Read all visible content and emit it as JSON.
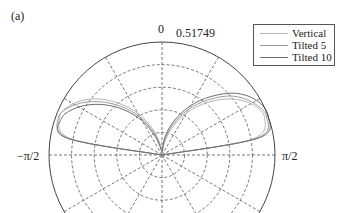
{
  "panel_label": "(a)",
  "chart_data": {
    "type": "polar-line",
    "title": "",
    "panel": "(a)",
    "theta_zero_location": "top",
    "theta_range_visible": [
      "-pi/2",
      "pi/2"
    ],
    "theta_tick_labels": {
      "top": "0",
      "left": "−π/2",
      "right": "π/2"
    },
    "r_max_label": "0.51749",
    "r_max": 0.51749,
    "r_rings": 5,
    "spoke_step_deg": 30,
    "grid": true,
    "legend_position": "upper right",
    "series": [
      {
        "name": "Vertical",
        "color": "#b4b4b4",
        "theta_deg": [
          -90,
          -80,
          -70,
          -60,
          -50,
          -40,
          -30,
          -20,
          -10,
          0,
          10,
          20,
          30,
          40,
          50,
          60,
          70,
          80,
          90
        ],
        "r": [
          0.0,
          0.42,
          0.5,
          0.47,
          0.4,
          0.31,
          0.22,
          0.13,
          0.05,
          0.0,
          0.05,
          0.13,
          0.22,
          0.31,
          0.4,
          0.47,
          0.5,
          0.42,
          0.0
        ]
      },
      {
        "name": "Tilted 5",
        "color": "#9a9a9a",
        "theta_deg": [
          -90,
          -80,
          -70,
          -60,
          -50,
          -40,
          -30,
          -20,
          -10,
          0,
          10,
          20,
          30,
          40,
          50,
          60,
          70,
          80,
          90
        ],
        "r": [
          0.0,
          0.43,
          0.505,
          0.46,
          0.38,
          0.29,
          0.2,
          0.11,
          0.04,
          0.01,
          0.07,
          0.15,
          0.24,
          0.33,
          0.42,
          0.48,
          0.51,
          0.44,
          0.0
        ]
      },
      {
        "name": "Tilted 10",
        "color": "#6e6e6e",
        "theta_deg": [
          -90,
          -80,
          -70,
          -60,
          -50,
          -40,
          -30,
          -20,
          -10,
          0,
          10,
          20,
          30,
          40,
          50,
          60,
          70,
          80,
          90
        ],
        "r": [
          0.0,
          0.44,
          0.49,
          0.44,
          0.36,
          0.27,
          0.18,
          0.09,
          0.03,
          0.02,
          0.09,
          0.17,
          0.26,
          0.35,
          0.44,
          0.5,
          0.5175,
          0.45,
          0.0
        ]
      }
    ]
  },
  "legend": {
    "items": [
      {
        "label": "Vertical",
        "color": "#b4b4b4"
      },
      {
        "label": "Tilted 5",
        "color": "#9a9a9a"
      },
      {
        "label": "Tilted 10",
        "color": "#6e6e6e"
      }
    ]
  }
}
